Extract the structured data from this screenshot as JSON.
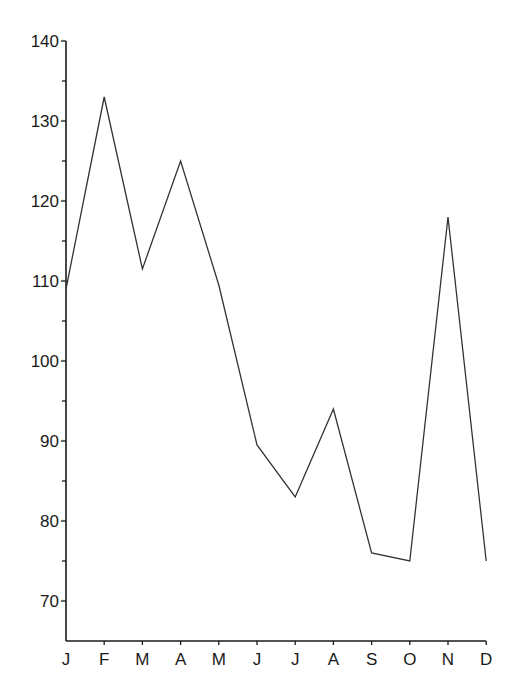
{
  "chart_data": {
    "type": "line",
    "title": "",
    "xlabel": "",
    "ylabel": "",
    "categories": [
      "J",
      "F",
      "M",
      "A",
      "M",
      "J",
      "J",
      "A",
      "S",
      "O",
      "N",
      "D"
    ],
    "series": [
      {
        "name": "series-1",
        "values": [
          109,
          133,
          111.5,
          125,
          109.5,
          89.5,
          83,
          94,
          76,
          75,
          118,
          75
        ]
      }
    ],
    "ylim": [
      65,
      140
    ],
    "yticks": [
      70,
      80,
      90,
      100,
      110,
      120,
      130,
      140
    ],
    "yminor_step": 5,
    "grid": false,
    "legend": null,
    "line_color": "#333333",
    "axis_color": "#1a1a1a"
  }
}
